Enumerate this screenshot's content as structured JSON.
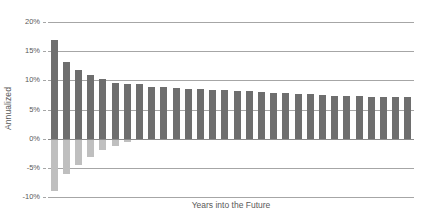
{
  "chart_data": {
    "type": "bar",
    "subtype": "floating-range-bar",
    "title": "",
    "xlabel": "Years into the Future",
    "ylabel": "Annualized",
    "ylim": [
      -10,
      20
    ],
    "yticks": [
      20,
      15,
      10,
      5,
      0,
      -5,
      -10
    ],
    "ytick_labels": [
      "20%",
      "15%",
      "10%",
      "5%",
      "0%",
      "-5%",
      "-10%"
    ],
    "y_unit": "%",
    "grid": true,
    "grid_axis": "y",
    "legend": "none",
    "xtick_labels": [],
    "categories": [
      1,
      2,
      3,
      4,
      5,
      6,
      7,
      8,
      9,
      10,
      11,
      12,
      13,
      14,
      15,
      16,
      17,
      18,
      19,
      20,
      21,
      22,
      23,
      24,
      25,
      26,
      27,
      28,
      29,
      30
    ],
    "colors": {
      "upper_segment": "#6e6e6e",
      "lower_segment": "#bfbfbf",
      "gridline": "#a6a6a6",
      "text": "#595959",
      "background": "#ffffff"
    },
    "series": [
      {
        "name": "Maximum annualized return",
        "segment": "upper",
        "values": [
          17.0,
          13.1,
          11.8,
          11.0,
          10.3,
          9.6,
          9.4,
          9.3,
          8.9,
          8.8,
          8.7,
          8.6,
          8.5,
          8.4,
          8.3,
          8.2,
          8.1,
          8.0,
          7.9,
          7.8,
          7.7,
          7.6,
          7.5,
          7.4,
          7.4,
          7.3,
          7.2,
          7.2,
          7.1,
          7.1
        ]
      },
      {
        "name": "Minimum annualized return",
        "segment": "lower",
        "values": [
          -9.0,
          -6.0,
          -4.5,
          -3.1,
          -2.0,
          -1.2,
          -0.6,
          -0.2,
          0.2,
          0.6,
          1.0,
          1.3,
          1.6,
          1.9,
          2.1,
          2.3,
          2.5,
          2.7,
          2.9,
          3.0,
          3.2,
          3.3,
          3.4,
          3.5,
          3.6,
          3.7,
          3.8,
          3.9,
          4.0,
          4.0
        ]
      }
    ]
  }
}
